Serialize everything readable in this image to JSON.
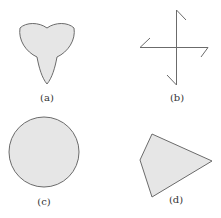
{
  "figure": {
    "panels": [
      {
        "id": "a",
        "label": "(a)",
        "shape": "trefoil"
      },
      {
        "id": "b",
        "label": "(b)",
        "shape": "pinwheel-cross"
      },
      {
        "id": "c",
        "label": "(c)",
        "shape": "circle"
      },
      {
        "id": "d",
        "label": "(d)",
        "shape": "quadrilateral"
      }
    ],
    "colors": {
      "fill": "#e6e6e6",
      "stroke": "#6b6b6b",
      "label": "#333333"
    }
  }
}
